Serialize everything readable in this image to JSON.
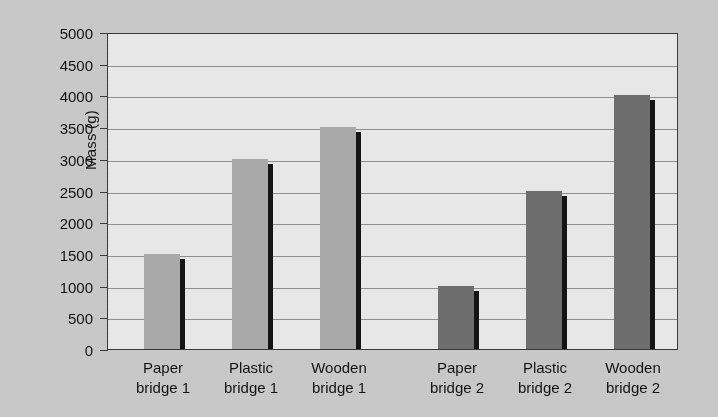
{
  "chart_data": {
    "type": "bar",
    "title": "",
    "xlabel": "",
    "ylabel": "Mass (g)",
    "ylim": [
      0,
      5000
    ],
    "ytick_step": 500,
    "grid": true,
    "legend": "none",
    "ytick_labels": [
      "5000",
      "4500",
      "4000",
      "3500",
      "3000",
      "2500",
      "2000",
      "1500",
      "1000",
      "500",
      "0"
    ],
    "ytick_values": [
      5000,
      4500,
      4000,
      3500,
      3000,
      2500,
      2000,
      1500,
      1000,
      500,
      0
    ],
    "categories": [
      "Paper bridge 1",
      "Plastic bridge 1",
      "Wooden bridge 1",
      "Paper bridge 2",
      "Plastic bridge 2",
      "Wooden bridge 2"
    ],
    "category_lines": [
      [
        "Paper",
        "bridge 1"
      ],
      [
        "Plastic",
        "bridge 1"
      ],
      [
        "Wooden",
        "bridge 1"
      ],
      [
        "Paper",
        "bridge 2"
      ],
      [
        "Plastic",
        "bridge 2"
      ],
      [
        "Wooden",
        "bridge 2"
      ]
    ],
    "values": [
      1500,
      3000,
      3500,
      1000,
      2500,
      4000
    ],
    "bar_colors": [
      "#a9a9a9",
      "#a9a9a9",
      "#a9a9a9",
      "#6e6e6e",
      "#6e6e6e",
      "#6e6e6e"
    ],
    "bars": [
      {
        "label": "Paper bridge 1",
        "value": 1500,
        "color": "#a9a9a9",
        "x": 36
      },
      {
        "label": "Plastic bridge 1",
        "value": 3000,
        "color": "#a9a9a9",
        "x": 124
      },
      {
        "label": "Wooden bridge 1",
        "value": 3500,
        "color": "#a9a9a9",
        "x": 212
      },
      {
        "label": "Paper bridge 2",
        "value": 1000,
        "color": "#6e6e6e",
        "x": 330
      },
      {
        "label": "Plastic bridge 2",
        "value": 2500,
        "color": "#6e6e6e",
        "x": 418
      },
      {
        "label": "Wooden bridge 2",
        "value": 4000,
        "color": "#6e6e6e",
        "x": 506
      }
    ]
  },
  "colors": {
    "page_background": "#c9c9c9",
    "plot_background": "#e8e8e8",
    "gridline": "#8f8f8f",
    "axis": "#3a3a3a",
    "bar_light": "#a9a9a9",
    "bar_dark": "#6e6e6e",
    "bar_shadow": "#151515",
    "text": "#131313"
  }
}
